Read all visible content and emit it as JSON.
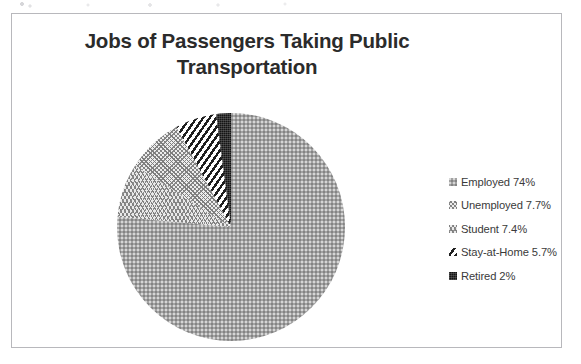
{
  "chart_data": {
    "type": "pie",
    "title": "Jobs of Passengers Taking Public Transportation",
    "title_line1": "Jobs of Passengers Taking Public",
    "title_line2": "Transportation",
    "categories": [
      "Employed",
      "Unemployed",
      "Student",
      "Stay-at-Home",
      "Retired"
    ],
    "values": [
      74,
      7.7,
      7.4,
      5.7,
      2
    ],
    "value_labels": [
      "74%",
      "7.7%",
      "7.4%",
      "5.7%",
      "2%"
    ],
    "legend_position": "right",
    "grid": false,
    "start_angle_deg": 0,
    "direction": "clockwise",
    "slice_order_clockwise_from_12": [
      "Employed",
      "Student",
      "Unemployed",
      "Stay-at-Home",
      "Retired"
    ],
    "slices": [
      {
        "label": "Employed",
        "value": 74,
        "value_label": "74%",
        "pattern": "fine-gray-stipple",
        "color": "#a3a3a3"
      },
      {
        "label": "Unemployed",
        "value": 7.7,
        "value_label": "7.7%",
        "pattern": "zigzag-light",
        "color": "#ededed"
      },
      {
        "label": "Student",
        "value": 7.4,
        "value_label": "7.4%",
        "pattern": "wavy-chevron-light",
        "color": "#e9e9e9"
      },
      {
        "label": "Stay-at-Home",
        "value": 5.7,
        "value_label": "5.7%",
        "pattern": "diagonal-stripes",
        "color": "#1f1f1f"
      },
      {
        "label": "Retired",
        "value": 2,
        "value_label": "2%",
        "pattern": "solid-dark",
        "color": "#141414"
      }
    ]
  },
  "legend": {
    "items": [
      {
        "label": "Employed 74%"
      },
      {
        "label": "Unemployed 7.7%"
      },
      {
        "label": "Student 7.4%"
      },
      {
        "label": "Stay-at-Home 5.7%"
      },
      {
        "label": "Retired 2%"
      }
    ]
  },
  "colors": {
    "title_text": "#2b2b2b",
    "legend_text": "#3a3a3a",
    "frame_border": "#b8b8bc",
    "background": "#ffffff"
  }
}
